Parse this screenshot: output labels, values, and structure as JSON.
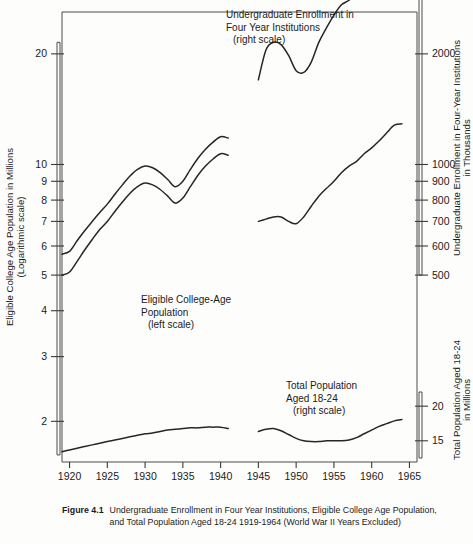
{
  "figure": {
    "number": "Figure 4.1",
    "caption": "Undergraduate Enrollment in Four Year Institutions, Eligible College Age Population, and Total Population Aged 18-24 1919-1964 (World War II Years Excluded)"
  },
  "axes": {
    "left": {
      "title_line1": "Eligible College Age Population in Millions",
      "title_line2": "(Logarithmic scale)",
      "scale": "log",
      "ticks": [
        "20",
        "10",
        "9",
        "8",
        "7",
        "6",
        "5",
        "4",
        "3",
        "2"
      ],
      "range": [
        1.55,
        26
      ]
    },
    "right_upper": {
      "title_line1": "Undergraduate Enrollment in Four-Year Institutions",
      "title_line2": "in Thousands",
      "scale": "log",
      "ticks": [
        "4000",
        "3000",
        "2000",
        "1000",
        "900",
        "800",
        "700",
        "600",
        "500"
      ],
      "range": [
        460,
        4700
      ]
    },
    "right_lower": {
      "title_line1": "Total Population Aged 18-24",
      "title_line2": "in Millions",
      "scale": "log",
      "ticks": [
        "20",
        "15"
      ],
      "range": [
        13.0,
        22.5
      ]
    },
    "bottom": {
      "ticks": [
        "1920",
        "1925",
        "1930",
        "1935",
        "1940",
        "1945",
        "1950",
        "1955",
        "1960",
        "1965"
      ],
      "range": [
        1919,
        1966
      ]
    }
  },
  "annotations": [
    {
      "name": "enrollment-label",
      "lines": [
        "Undergraduate Enrollment in",
        "Four Year Institutions",
        "(right scale)"
      ]
    },
    {
      "name": "eligible-label",
      "lines": [
        "Eligible College-Age",
        "Population",
        "(left scale)"
      ]
    },
    {
      "name": "total-population-label",
      "lines": [
        "Total Population",
        "Aged 18-24",
        "(right scale)"
      ]
    }
  ],
  "chart_data": {
    "type": "line",
    "title": "Undergraduate Enrollment in Four Year Institutions, Eligible College Age Population, and Total Population Aged 18-24 1919-1964 (World War II Years Excluded)",
    "xlabel": "",
    "ylabel": "Eligible College Age Population in Millions (Logarithmic scale)",
    "xlim": [
      1919,
      1966
    ],
    "grid": false,
    "legend": "inline-annotations",
    "note": "World War II years (1942-1944) excluded; each series is drawn as two segments",
    "series": [
      {
        "name": "Eligible College-Age Population",
        "scale": "left",
        "units": "millions",
        "segments": [
          {
            "period": "pre-war",
            "x": [
              1919,
              1920,
              1921,
              1922,
              1923,
              1924,
              1925,
              1926,
              1927,
              1928,
              1929,
              1930,
              1931,
              1932,
              1933,
              1934,
              1935,
              1936,
              1937,
              1938,
              1939,
              1940,
              1941
            ],
            "y": [
              5.7,
              5.8,
              6.2,
              6.6,
              7.0,
              7.4,
              7.8,
              8.3,
              8.8,
              9.3,
              9.7,
              9.9,
              9.8,
              9.5,
              9.1,
              8.7,
              9.0,
              9.7,
              10.4,
              11.0,
              11.5,
              11.9,
              11.8
            ]
          },
          {
            "period": "post-war",
            "x": [
              1945,
              1946,
              1947,
              1948,
              1949,
              1950,
              1951,
              1952,
              1953,
              1954,
              1955,
              1956,
              1957,
              1958,
              1959,
              1960,
              1961,
              1962,
              1963,
              1964
            ],
            "y": [
              7.0,
              7.1,
              7.2,
              7.2,
              7.0,
              6.9,
              7.2,
              7.7,
              8.2,
              8.6,
              9.0,
              9.5,
              9.9,
              10.2,
              10.7,
              11.1,
              11.6,
              12.2,
              12.8,
              12.9
            ]
          }
        ]
      },
      {
        "name": "Undergraduate Enrollment in Four Year Institutions",
        "scale": "right_upper",
        "units": "thousands",
        "segments": [
          {
            "period": "pre-war",
            "x": [
              1919,
              1920,
              1921,
              1922,
              1923,
              1924,
              1925,
              1926,
              1927,
              1928,
              1929,
              1930,
              1931,
              1932,
              1933,
              1934,
              1935,
              1936,
              1937,
              1938,
              1939,
              1940,
              1941
            ],
            "y": [
              500,
              510,
              545,
              585,
              625,
              665,
              700,
              745,
              790,
              835,
              870,
              890,
              880,
              855,
              820,
              785,
              810,
              870,
              935,
              990,
              1035,
              1070,
              1060
            ]
          },
          {
            "period": "post-war",
            "x": [
              1945,
              1946,
              1947,
              1948,
              1949,
              1950,
              1951,
              1952,
              1953,
              1954,
              1955,
              1956,
              1957,
              1958,
              1959,
              1960,
              1961,
              1962,
              1963,
              1964
            ],
            "y": [
              1700,
              2050,
              2150,
              2120,
              1980,
              1800,
              1780,
              1900,
              2150,
              2350,
              2550,
              2720,
              2800,
              2950,
              3150,
              3300,
              3500,
              3700,
              3880,
              4050
            ]
          }
        ]
      },
      {
        "name": "Total Population Aged 18-24",
        "scale": "right_lower",
        "units": "millions",
        "segments": [
          {
            "period": "pre-war",
            "x": [
              1919,
              1920,
              1921,
              1922,
              1923,
              1924,
              1925,
              1926,
              1927,
              1928,
              1929,
              1930,
              1931,
              1932,
              1933,
              1934,
              1935,
              1936,
              1937,
              1938,
              1939,
              1940,
              1941
            ],
            "y": [
              13.7,
              13.9,
              14.1,
              14.3,
              14.5,
              14.7,
              14.9,
              15.1,
              15.3,
              15.5,
              15.7,
              15.9,
              16.0,
              16.2,
              16.4,
              16.5,
              16.6,
              16.7,
              16.7,
              16.8,
              16.8,
              16.8,
              16.6
            ]
          },
          {
            "period": "post-war",
            "x": [
              1945,
              1946,
              1947,
              1948,
              1949,
              1950,
              1951,
              1952,
              1953,
              1954,
              1955,
              1956,
              1957,
              1958,
              1959,
              1960,
              1961,
              1962,
              1963,
              1964
            ],
            "y": [
              16.2,
              16.5,
              16.6,
              16.3,
              15.8,
              15.3,
              15.0,
              14.9,
              14.9,
              15.0,
              15.0,
              15.0,
              15.1,
              15.4,
              15.9,
              16.4,
              16.9,
              17.3,
              17.7,
              17.9
            ]
          }
        ]
      }
    ]
  }
}
